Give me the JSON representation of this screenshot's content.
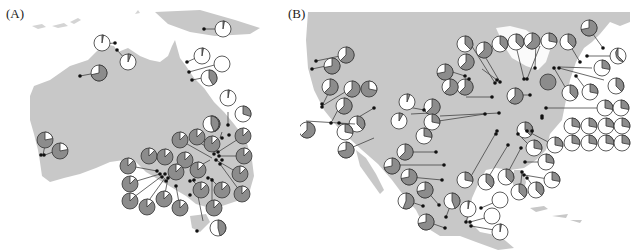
{
  "figure": {
    "panels": [
      {
        "label": "(A)",
        "region": "Australia",
        "land_color": "#c8c8c8",
        "pie_dark_color": "#8a8a8a",
        "pie_light_color": "#ffffff",
        "site_count": 41
      },
      {
        "label": "(B)",
        "region": "North America",
        "land_color": "#c8c8c8",
        "pie_dark_color": "#8a8a8a",
        "pie_light_color": "#ffffff",
        "site_count": 70
      }
    ],
    "colors": {
      "land": "#c8c8c8",
      "pie_dark": "#8c8c8c",
      "pie_light": "#ffffff",
      "outline": "#333333",
      "site_dot": "#111111",
      "leader_line": "#444444"
    }
  }
}
